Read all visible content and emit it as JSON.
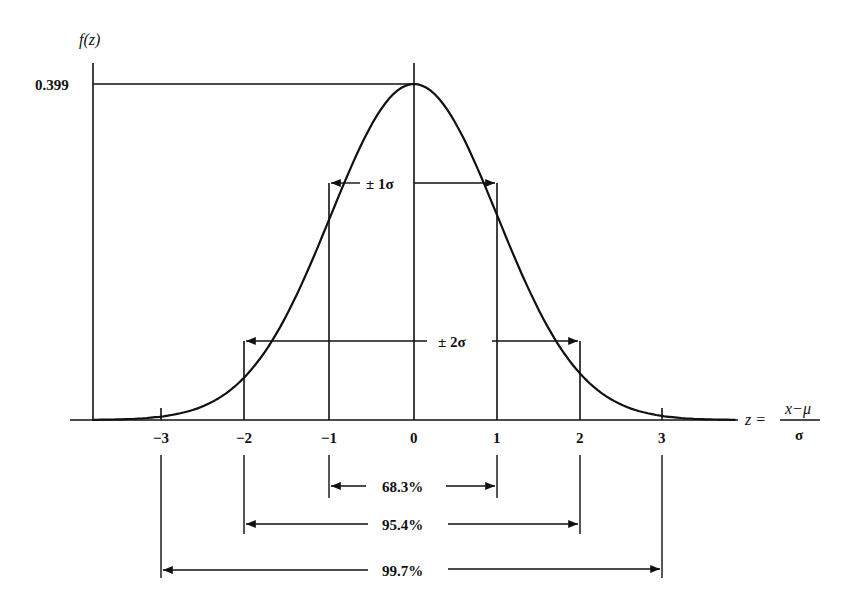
{
  "chart_data": {
    "type": "line",
    "xlabel": "z = (x−μ)/σ",
    "ylabel": "f(z)",
    "x_ticks": [
      -3,
      -2,
      -1,
      0,
      1,
      2,
      3
    ],
    "y_ticks": [
      0.399
    ],
    "peak": {
      "z": 0,
      "f": 0.399
    },
    "series": [
      {
        "name": "f(z)",
        "function": "standard normal pdf"
      }
    ],
    "annotations": [
      {
        "label": "± 1σ",
        "from": -1,
        "to": 1
      },
      {
        "label": "± 2σ",
        "from": -2,
        "to": 2
      },
      {
        "label": "68.3%",
        "from": -1,
        "to": 1
      },
      {
        "label": "95.4%",
        "from": -2,
        "to": 2
      },
      {
        "label": "99.7%",
        "from": -3,
        "to": 3
      }
    ]
  },
  "labels": {
    "y_axis": "f(z)",
    "peak_value": "0.399",
    "z_eq": "z =",
    "frac_num": "x−μ",
    "frac_den": "σ",
    "ticks": [
      "−3",
      "−2",
      "−1",
      "0",
      "1",
      "2",
      "3"
    ],
    "one_sigma": "± 1σ",
    "two_sigma": "± 2σ",
    "pct_1": "68.3%",
    "pct_2": "95.4%",
    "pct_3": "99.7%"
  }
}
